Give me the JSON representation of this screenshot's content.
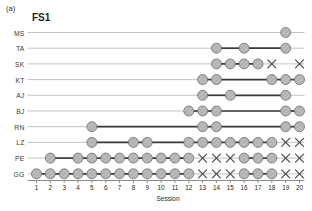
{
  "panel": {
    "tag": "(a)",
    "title": "FS1"
  },
  "axis": {
    "xlabel": "Session",
    "xticks": [
      "1",
      "2",
      "3",
      "4",
      "5",
      "6",
      "7",
      "8",
      "9",
      "10",
      "11",
      "12",
      "13",
      "14",
      "15",
      "16",
      "17",
      "18",
      "19",
      "20"
    ],
    "xmin": 1,
    "xmax": 20,
    "row_labels": [
      "MS",
      "TA",
      "SK",
      "KT",
      "AJ",
      "BJ",
      "RN",
      "LZ",
      "PE",
      "GG"
    ]
  },
  "colors": {
    "marker_fill": "#b4b4b4",
    "marker_stroke": "#6e6e6e",
    "segment": "#3a3a3a",
    "baseline": "#a9a9a9",
    "axis": "#6e6e6e",
    "text": "#231f20",
    "cross": "#4a4a4a"
  },
  "legend_note": "circle = attended session, x = missed session",
  "chart_data": {
    "type": "scatter",
    "title": "FS1",
    "xlabel": "Session",
    "ylabel": "",
    "xlim": [
      1,
      20
    ],
    "categories": [
      "1",
      "2",
      "3",
      "4",
      "5",
      "6",
      "7",
      "8",
      "9",
      "10",
      "11",
      "12",
      "13",
      "14",
      "15",
      "16",
      "17",
      "18",
      "19",
      "20"
    ],
    "grid": false,
    "legend": "none",
    "marker_types": {
      "circle": "present",
      "x": "absent"
    },
    "series": [
      {
        "name": "MS",
        "circles": [
          19
        ],
        "crosses": [],
        "segments": []
      },
      {
        "name": "TA",
        "circles": [
          14,
          16,
          19
        ],
        "crosses": [],
        "segments": [
          [
            14,
            16
          ],
          [
            16,
            19
          ]
        ]
      },
      {
        "name": "SK",
        "circles": [
          14,
          15,
          16,
          17
        ],
        "crosses": [
          18,
          20
        ],
        "segments": [
          [
            14,
            17
          ]
        ]
      },
      {
        "name": "KT",
        "circles": [
          13,
          14,
          18,
          19,
          20
        ],
        "crosses": [],
        "segments": [
          [
            13,
            14
          ],
          [
            14,
            18
          ],
          [
            18,
            20
          ]
        ]
      },
      {
        "name": "AJ",
        "circles": [
          13,
          15,
          19
        ],
        "crosses": [],
        "segments": [
          [
            13,
            15
          ],
          [
            15,
            19
          ]
        ]
      },
      {
        "name": "BJ",
        "circles": [
          12,
          13,
          14,
          19,
          20
        ],
        "crosses": [],
        "segments": [
          [
            12,
            14
          ],
          [
            14,
            19
          ],
          [
            19,
            20
          ]
        ]
      },
      {
        "name": "RN",
        "circles": [
          5,
          13,
          14,
          19,
          20
        ],
        "crosses": [],
        "segments": [
          [
            5,
            13
          ],
          [
            13,
            14
          ],
          [
            14,
            19
          ],
          [
            19,
            20
          ]
        ]
      },
      {
        "name": "LZ",
        "circles": [
          5,
          8,
          9,
          12,
          13,
          14,
          15,
          16,
          17,
          18
        ],
        "crosses": [
          19,
          20
        ],
        "segments": [
          [
            5,
            9
          ],
          [
            9,
            12
          ],
          [
            12,
            18
          ]
        ]
      },
      {
        "name": "PE",
        "circles": [
          2,
          4,
          5,
          6,
          7,
          8,
          9,
          10,
          11,
          12,
          16,
          17,
          18
        ],
        "crosses": [
          13,
          14,
          15,
          19,
          20
        ],
        "segments": [
          [
            2,
            4
          ],
          [
            4,
            12
          ],
          [
            16,
            18
          ]
        ]
      },
      {
        "name": "GG",
        "circles": [
          1,
          2,
          3,
          4,
          5,
          6,
          7,
          8,
          9,
          10,
          11,
          12,
          16,
          17,
          18
        ],
        "crosses": [
          13,
          14,
          15,
          19,
          20
        ],
        "segments": [
          [
            1,
            12
          ],
          [
            16,
            18
          ]
        ]
      }
    ]
  }
}
